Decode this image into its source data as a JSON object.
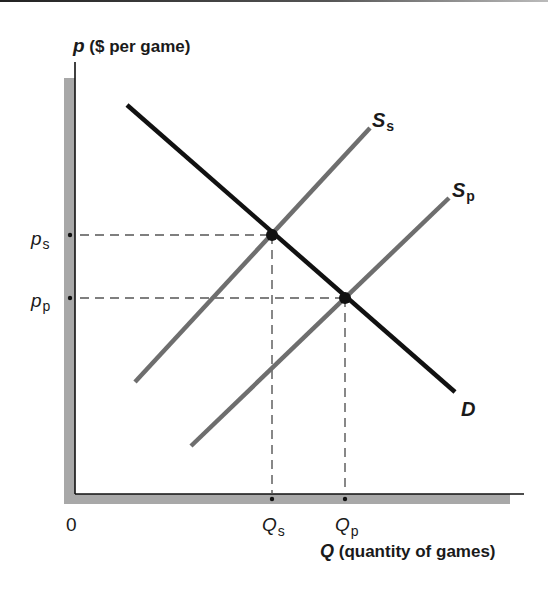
{
  "chart_data": {
    "type": "line",
    "title": "",
    "xlabel": "Q (quantity of games)",
    "ylabel": "p ($ per game)",
    "xlabel_var": "Q",
    "xlabel_rest": " (quantity of games)",
    "ylabel_var": "p",
    "ylabel_rest": " ($ per game)",
    "origin_label": "0",
    "x_ticks": [
      {
        "label": "Q",
        "sub": "s",
        "px": 272
      },
      {
        "label": "Q",
        "sub": "p",
        "px": 345
      }
    ],
    "y_ticks": [
      {
        "label": "p",
        "sub": "s",
        "py": 235
      },
      {
        "label": "p",
        "sub": "p",
        "py": 298
      }
    ],
    "series": [
      {
        "name": "D",
        "label": "D",
        "kind": "demand",
        "color": "#111111",
        "points": [
          [
            127,
            105
          ],
          [
            455,
            392
          ]
        ]
      },
      {
        "name": "Ss",
        "label": "S",
        "sub": "s",
        "kind": "supply",
        "color": "#6e6e6e",
        "points": [
          [
            135,
            382
          ],
          [
            370,
            128
          ]
        ]
      },
      {
        "name": "Sp",
        "label": "S",
        "sub": "p",
        "kind": "supply",
        "color": "#6e6e6e",
        "points": [
          [
            191,
            446
          ],
          [
            449,
            198
          ]
        ]
      }
    ],
    "equilibria": [
      {
        "name": "e_s",
        "price": "p_s",
        "quantity": "Q_s",
        "px": 272,
        "py": 235
      },
      {
        "name": "e_p",
        "price": "p_p",
        "quantity": "Q_p",
        "px": 345,
        "py": 298
      }
    ],
    "axes": {
      "origin_px": [
        75,
        494
      ],
      "x_end_px": 524,
      "y_top_px": 62
    },
    "grid": false,
    "legend": "none (curves labeled directly)",
    "colors": {
      "axis": "#111111",
      "shadow": "#a8a8a8",
      "demand": "#111111",
      "supply": "#6e6e6e",
      "guide": "#555555"
    }
  }
}
